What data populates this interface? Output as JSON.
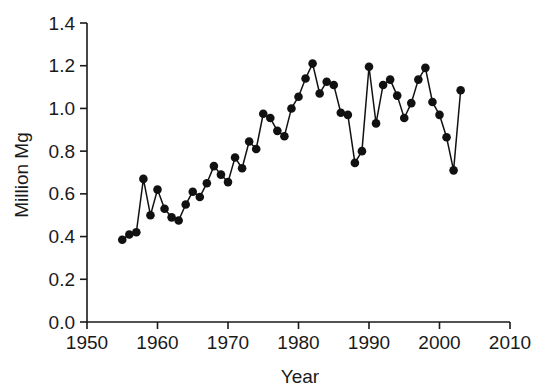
{
  "chart_data": {
    "type": "line",
    "title": "",
    "xlabel": "Year",
    "ylabel": "Million Mg",
    "xlim": [
      1950,
      2010
    ],
    "ylim": [
      0.0,
      1.4
    ],
    "xticks": [
      1950,
      1960,
      1970,
      1980,
      1990,
      2000,
      2010
    ],
    "xtick_labels": [
      "1950",
      "1960",
      "1970",
      "1980",
      "1990",
      "2000",
      "2010"
    ],
    "yticks": [
      0.0,
      0.2,
      0.4,
      0.6,
      0.8,
      1.0,
      1.2,
      1.4
    ],
    "ytick_labels": [
      "0.0",
      "0.2",
      "0.4",
      "0.6",
      "0.8",
      "1.0",
      "1.2",
      "1.4"
    ],
    "grid": false,
    "legend": false,
    "marker": "filled-circle",
    "marker_color": "#111111",
    "line_color": "#111111",
    "x": [
      1955,
      1956,
      1957,
      1958,
      1959,
      1960,
      1961,
      1962,
      1963,
      1964,
      1965,
      1966,
      1967,
      1968,
      1969,
      1970,
      1971,
      1972,
      1973,
      1974,
      1975,
      1976,
      1977,
      1978,
      1979,
      1980,
      1981,
      1982,
      1983,
      1984,
      1985,
      1986,
      1987,
      1988,
      1989,
      1990,
      1991,
      1992,
      1993,
      1994,
      1995,
      1996,
      1997,
      1998,
      1999,
      2000,
      2001,
      2002,
      2003
    ],
    "values": [
      0.385,
      0.41,
      0.42,
      0.67,
      0.5,
      0.62,
      0.53,
      0.49,
      0.475,
      0.55,
      0.61,
      0.585,
      0.65,
      0.73,
      0.69,
      0.655,
      0.77,
      0.72,
      0.845,
      0.81,
      0.975,
      0.955,
      0.895,
      0.87,
      1.0,
      1.055,
      1.14,
      1.21,
      1.07,
      1.125,
      1.11,
      0.98,
      0.97,
      0.745,
      0.8,
      1.195,
      0.93,
      1.11,
      1.135,
      1.06,
      0.955,
      1.025,
      1.135,
      1.19,
      1.03,
      0.97,
      0.865,
      0.71,
      1.085
    ],
    "series": [
      {
        "name": "Million Mg",
        "values": [
          0.385,
          0.41,
          0.42,
          0.67,
          0.5,
          0.62,
          0.53,
          0.49,
          0.475,
          0.55,
          0.61,
          0.585,
          0.65,
          0.73,
          0.69,
          0.655,
          0.77,
          0.72,
          0.845,
          0.81,
          0.975,
          0.955,
          0.895,
          0.87,
          1.0,
          1.055,
          1.14,
          1.21,
          1.07,
          1.125,
          1.11,
          0.98,
          0.97,
          0.745,
          0.8,
          1.195,
          0.93,
          1.11,
          1.135,
          1.06,
          0.955,
          1.025,
          1.135,
          1.19,
          1.03,
          0.97,
          0.865,
          0.71,
          1.085
        ]
      }
    ]
  },
  "figure": {
    "background_color": "#ffffff",
    "foreground_color": "#111111"
  }
}
